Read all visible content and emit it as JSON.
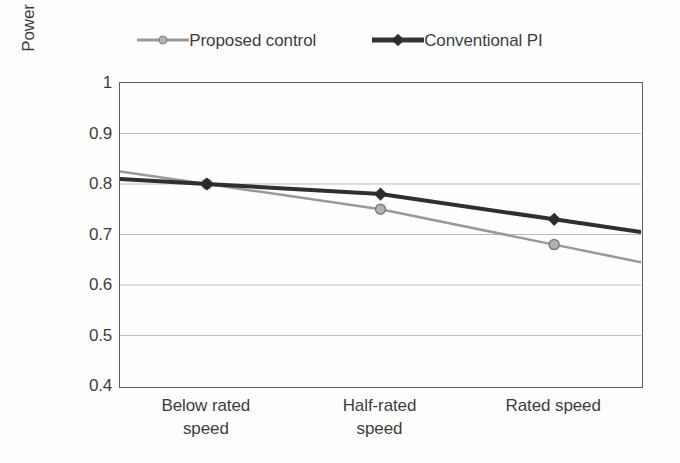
{
  "chart_data": {
    "type": "line",
    "title": "",
    "xlabel": "",
    "ylabel": "Power requirement (p.u.)",
    "categories": [
      "Below rated speed",
      "Half-rated speed",
      "Rated speed"
    ],
    "category_lines": [
      [
        "Below rated",
        "speed"
      ],
      [
        "Half-rated",
        "speed"
      ],
      [
        "Rated speed",
        ""
      ]
    ],
    "series": [
      {
        "name": "Proposed control",
        "values": [
          0.8,
          0.75,
          0.68
        ],
        "color": "#8c8c8c",
        "marker": "circle",
        "marker_fill": "#a8a8a8",
        "marker_stroke": "#6e6e6e",
        "line_width": 2.5
      },
      {
        "name": "Conventional PI",
        "values": [
          0.8,
          0.78,
          0.73
        ],
        "color": "#141414",
        "marker": "diamond",
        "marker_fill": "#111111",
        "marker_stroke": "#111111",
        "line_width": 4
      }
    ],
    "ylim": [
      0.4,
      1.0
    ],
    "yticks": [
      1,
      0.9,
      0.8,
      0.7,
      0.6,
      0.5,
      0.4
    ],
    "ytick_labels": [
      "1",
      "0.9",
      "0.8",
      "0.7",
      "0.6",
      "0.5",
      "0.4"
    ],
    "grid": {
      "horizontal": true,
      "vertical": false,
      "color": "#b5b5b5",
      "values": [
        0.9,
        0.8,
        0.7,
        0.6,
        0.5
      ]
    },
    "legend": {
      "position": "top",
      "orientation": "horizontal",
      "border": false,
      "entries": [
        "Proposed control",
        "Conventional PI"
      ]
    },
    "plot_frame": {
      "border_color": "#4a4a4a",
      "background": "#ffffff"
    }
  }
}
